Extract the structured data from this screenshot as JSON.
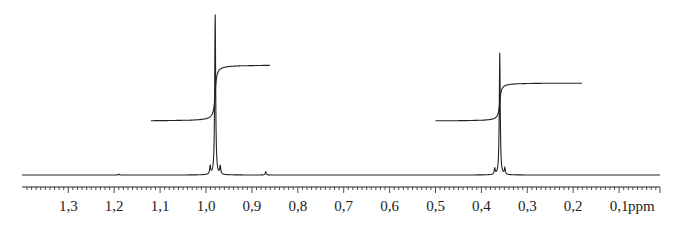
{
  "chart_data": {
    "type": "line",
    "title": "",
    "xlabel": "ppm",
    "ylabel": "",
    "x_reversed": true,
    "xlim": [
      1.4,
      0.0
    ],
    "tick_labels": [
      "1,3",
      "1,2",
      "1,1",
      "1,0",
      "0,9",
      "0,8",
      "0,7",
      "0,6",
      "0,5",
      "0,4",
      "0,3",
      "0,2",
      "0,1"
    ],
    "tick_values": [
      1.3,
      1.2,
      1.1,
      1.0,
      0.9,
      0.8,
      0.7,
      0.6,
      0.5,
      0.4,
      0.3,
      0.2,
      0.1
    ],
    "grid": false,
    "peaks": [
      {
        "ppm": 0.98,
        "relative_height": 1.0,
        "shape": "singlet with small satellites"
      },
      {
        "ppm": 0.36,
        "relative_height": 0.75,
        "shape": "singlet with small satellites"
      },
      {
        "ppm": 0.87,
        "relative_height": 0.02,
        "shape": "minor impurity"
      },
      {
        "ppm": 1.19,
        "relative_height": 0.005,
        "shape": "minor impurity"
      }
    ],
    "integrals": [
      {
        "from_ppm": 1.12,
        "to_ppm": 0.86,
        "start_level": 0.0,
        "end_level": 1.0,
        "relative": 1.0
      },
      {
        "from_ppm": 0.5,
        "to_ppm": 0.18,
        "start_level": 0.0,
        "end_level": 0.75,
        "relative": 0.75
      }
    ]
  },
  "axis": {
    "unit": "ppm",
    "color": "#222222"
  },
  "colors": {
    "trace": "#222222",
    "background": "#ffffff"
  }
}
